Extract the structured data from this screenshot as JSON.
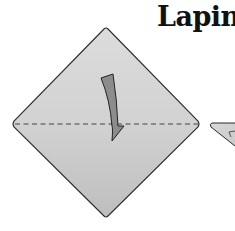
{
  "title": "Lapin",
  "diagram": {
    "step1": {
      "shape": "square paper rotated 45° (diamond)",
      "fold_line": "horizontal dashed valley fold",
      "arrow": "curved arrow pointing down",
      "paper_color_top": "#d4d4d4",
      "paper_color_bottom": "#c4c4c4",
      "arrow_color": "#8a8a8a"
    },
    "step2": {
      "shape": "partial triangle (cropped at right edge)"
    }
  }
}
